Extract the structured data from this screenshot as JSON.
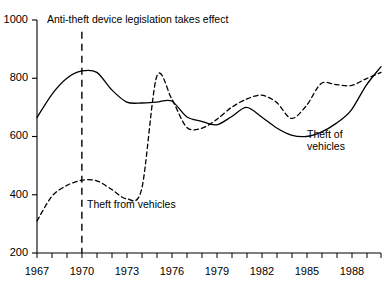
{
  "chart_data": {
    "type": "line",
    "title": "",
    "subtitle": "",
    "xlabel": "",
    "ylabel": "",
    "xlim": [
      1967,
      1990
    ],
    "ylim": [
      200,
      1000
    ],
    "grid": false,
    "legend_position": "inline-annotations",
    "y_ticks": [
      200,
      400,
      600,
      800,
      1000
    ],
    "y_tick_labels": [
      "200",
      "400",
      "600",
      "800",
      "1000"
    ],
    "x_ticks": [
      1967,
      1968,
      1969,
      1970,
      1971,
      1972,
      1973,
      1974,
      1975,
      1976,
      1977,
      1978,
      1979,
      1980,
      1981,
      1982,
      1983,
      1984,
      1985,
      1986,
      1987,
      1988,
      1989,
      1990
    ],
    "x_tick_labels_shown": [
      "1967",
      "1970",
      "1973",
      "1976",
      "1979",
      "1982",
      "1985",
      "1988"
    ],
    "x_tick_label_years": [
      1967,
      1970,
      1973,
      1976,
      1979,
      1982,
      1985,
      1988
    ],
    "x": [
      1967,
      1968,
      1969,
      1970,
      1971,
      1972,
      1973,
      1974,
      1975,
      1976,
      1977,
      1978,
      1979,
      1980,
      1981,
      1982,
      1983,
      1984,
      1985,
      1986,
      1987,
      1988,
      1989,
      1990
    ],
    "series": [
      {
        "name": "Theft of vehicles",
        "style": "solid",
        "color": "#000000",
        "values": [
          665,
          745,
          800,
          825,
          820,
          760,
          718,
          715,
          718,
          722,
          668,
          652,
          640,
          668,
          700,
          668,
          630,
          605,
          600,
          615,
          645,
          690,
          775,
          840
        ]
      },
      {
        "name": "Theft from vehicles",
        "style": "dashed",
        "color": "#000000",
        "values": [
          310,
          395,
          432,
          450,
          448,
          418,
          386,
          420,
          805,
          730,
          632,
          628,
          658,
          700,
          728,
          742,
          718,
          662,
          705,
          782,
          778,
          775,
          798,
          820
        ]
      }
    ],
    "annotations": [
      {
        "name": "legislation-marker",
        "text": "Anti-theft device legislation takes effect",
        "year": 1970,
        "style": "vertical-dashed-line",
        "y_top": 960,
        "y_bottom": 200
      },
      {
        "name": "theft-from-vehicles-label",
        "text": "Theft from vehicles",
        "year": 1970.6,
        "value": 352
      },
      {
        "name": "theft-of-vehicles-label",
        "text": "Theft of vehicles",
        "year": 1985.4,
        "value": 570
      }
    ]
  },
  "labels": {
    "annotation_legislation": "Anti-theft device legislation takes effect",
    "series_theft_from": "Theft from vehicles",
    "series_theft_of_line1": "Theft of",
    "series_theft_of_line2": "vehicles"
  },
  "axis": {
    "y_labels": [
      "1000",
      "800",
      "600",
      "400",
      "200"
    ],
    "x_labels": [
      "1967",
      "1970",
      "1973",
      "1976",
      "1979",
      "1982",
      "1985",
      "1988"
    ]
  }
}
